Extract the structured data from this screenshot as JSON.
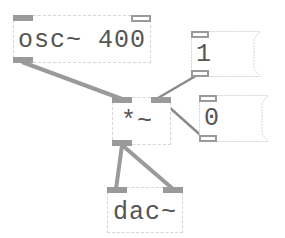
{
  "patch": {
    "objects": [
      {
        "id": "osc",
        "type": "object",
        "text": "osc~ 400"
      },
      {
        "id": "msg1",
        "type": "message",
        "text": "1"
      },
      {
        "id": "msg0",
        "type": "message",
        "text": "0"
      },
      {
        "id": "mul",
        "type": "object",
        "text": "*~"
      },
      {
        "id": "dac",
        "type": "object",
        "text": "dac~"
      }
    ],
    "connections": [
      {
        "from": "osc~ 400 outlet 0",
        "to": "*~ inlet 0"
      },
      {
        "from": "1 outlet 0",
        "to": "*~ inlet 1"
      },
      {
        "from": "0 outlet 0",
        "to": "*~ inlet 1"
      },
      {
        "from": "*~ outlet 0",
        "to": "dac~ inlet 0"
      },
      {
        "from": "*~ outlet 0",
        "to": "dac~ inlet 1"
      }
    ]
  },
  "colors": {
    "wire": "#9a9a9a",
    "port": "#9a9a9a",
    "border": "#d6d6d6",
    "text": "#555555"
  }
}
